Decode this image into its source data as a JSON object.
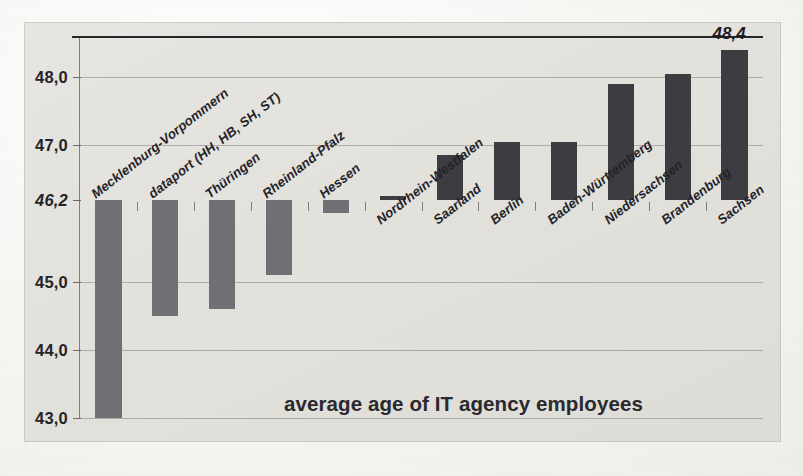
{
  "chart_data": {
    "type": "bar",
    "title": "average age of IT agency employees",
    "xlabel": "",
    "ylabel": "",
    "ylim": [
      43.0,
      48.6
    ],
    "baseline": 46.2,
    "baseline_label": "46,2",
    "grid": true,
    "legend": "none",
    "decimal_separator": ",",
    "categories": [
      "Mecklenburg-Vorpommern",
      "dataport (HH, HB, SH, ST)",
      "Thüringen",
      "Rheinland-Pfalz",
      "Hessen",
      "Nordrhein-Westfalen",
      "Saarland",
      "Berlin",
      "Baden-Württemberg",
      "Niedersachsen",
      "Brandenburg",
      "Sachsen"
    ],
    "values": [
      43.0,
      44.5,
      44.6,
      45.1,
      46.0,
      46.25,
      46.85,
      47.05,
      47.05,
      47.9,
      48.05,
      48.4
    ],
    "value_labels": [
      "",
      "",
      "",
      "",
      "",
      "",
      "",
      "",
      "",
      "",
      "",
      "48,4"
    ],
    "yticks": [
      48.0,
      47.0,
      46.2,
      45.0,
      44.0,
      43.0
    ],
    "ytick_labels": [
      "48,0",
      "47,0",
      "46,2",
      "45,0",
      "44,0",
      "43,0"
    ],
    "series_colors": {
      "above_baseline": "#3d3c40",
      "below_baseline": "#716f74"
    },
    "annotations": [
      "48,4"
    ]
  },
  "page": {
    "bleed_text": [
      "eine gute Grundlage",
      "Die Altersstruktur der",
      "vorhanden sein"
    ]
  }
}
